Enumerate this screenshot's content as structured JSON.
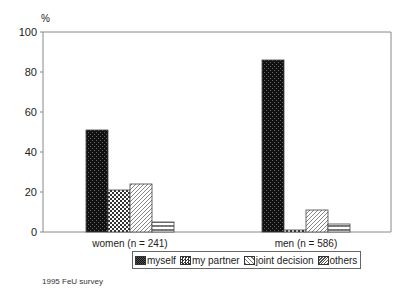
{
  "chart_data": {
    "type": "bar",
    "title": "",
    "ylabel": "%",
    "xlabel": "",
    "ylim": [
      0,
      100
    ],
    "yticks": [
      0,
      20,
      40,
      60,
      80,
      100
    ],
    "grid": false,
    "legend_position": "bottom",
    "categories": [
      "women (n = 241)",
      "men (n = 586)"
    ],
    "series": [
      {
        "name": "myself",
        "values": [
          51,
          86
        ],
        "pattern": "dark-check"
      },
      {
        "name": "my partner",
        "values": [
          21,
          1
        ],
        "pattern": "check"
      },
      {
        "name": "joint decision",
        "values": [
          24,
          11
        ],
        "pattern": "diagonal"
      },
      {
        "name": "others",
        "values": [
          5,
          4
        ],
        "pattern": "zigzag"
      }
    ]
  },
  "footnote": "1995 FeU survey"
}
